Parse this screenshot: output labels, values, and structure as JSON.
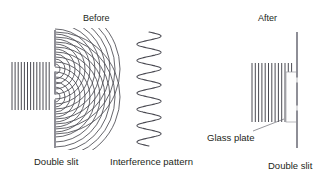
{
  "figure": {
    "kind": "physics-diagram",
    "background_color": "#ffffff",
    "ink_color": "#4a4a52",
    "barrier_color": "#8e8e96",
    "text_color": "#231f20"
  },
  "panels": {
    "before": {
      "title": "Before",
      "title_x": 83,
      "title_y": 14,
      "caption": "Double slit",
      "caption_x": 34,
      "caption_y": 157,
      "plane_waves": {
        "x_start": 12,
        "x_end": 50,
        "y_top": 62,
        "y_bottom": 110,
        "count": 13,
        "spacing": 3.1
      },
      "barrier": {
        "x": 55,
        "y_top": 30,
        "y_bottom": 148,
        "width": 2.0,
        "slits": [
          {
            "center_y": 69,
            "gap": 5
          },
          {
            "center_y": 97,
            "gap": 5
          }
        ]
      },
      "circular_waves": {
        "sources": [
          {
            "x": 55,
            "y": 69
          },
          {
            "x": 55,
            "y": 97
          }
        ],
        "ring_count": 13,
        "ring_spacing": 5.0,
        "first_radius": 5.0
      }
    },
    "interference": {
      "caption": "Interference pattern",
      "caption_x": 110,
      "caption_y": 157,
      "wave": {
        "axis_x": 149,
        "y_top": 32,
        "y_bottom": 146,
        "amplitude": 12,
        "cycles": 7
      }
    },
    "after": {
      "title": "After",
      "title_x": 258,
      "title_y": 14,
      "caption": "Double slit",
      "caption_x": 268,
      "caption_y": 161,
      "plane_waves": {
        "x_start": 252,
        "x_end": 292,
        "y_top": 63,
        "y_bottom": 122,
        "count": 13,
        "spacing": 3.3
      },
      "barrier": {
        "x": 297,
        "y_top": 32,
        "y_bottom": 148,
        "width": 2.0,
        "slits": [
          {
            "center_y": 80,
            "gap": 5
          },
          {
            "center_y": 108,
            "gap": 5
          }
        ]
      },
      "glass_plate": {
        "label": "Glass plate",
        "label_x": 207,
        "label_y": 133,
        "x": 286,
        "y": 72,
        "width": 11,
        "height": 50,
        "leader": {
          "x1": 253,
          "y1": 131,
          "x2": 284,
          "y2": 119
        }
      }
    }
  }
}
